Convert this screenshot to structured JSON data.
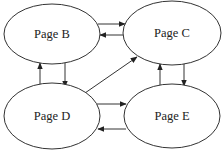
{
  "diagram": {
    "type": "directed-graph",
    "nodes": [
      {
        "id": "B",
        "label": "Page B",
        "cx": 52,
        "cy": 34,
        "rx": 48,
        "ry": 30
      },
      {
        "id": "C",
        "label": "Page C",
        "cx": 172,
        "cy": 33,
        "rx": 49,
        "ry": 32
      },
      {
        "id": "D",
        "label": "Page D",
        "cx": 52,
        "cy": 116,
        "rx": 48,
        "ry": 33
      },
      {
        "id": "E",
        "label": "Page E",
        "cx": 172,
        "cy": 116,
        "rx": 48,
        "ry": 32
      }
    ],
    "edges": [
      {
        "from": "B",
        "to": "C"
      },
      {
        "from": "C",
        "to": "B"
      },
      {
        "from": "B",
        "to": "D"
      },
      {
        "from": "D",
        "to": "B"
      },
      {
        "from": "C",
        "to": "E"
      },
      {
        "from": "E",
        "to": "C"
      },
      {
        "from": "D",
        "to": "E"
      },
      {
        "from": "E",
        "to": "D"
      },
      {
        "from": "D",
        "to": "C"
      }
    ],
    "colors": {
      "stroke": "#333333",
      "fill": "#ffffff",
      "text": "#222222"
    }
  }
}
